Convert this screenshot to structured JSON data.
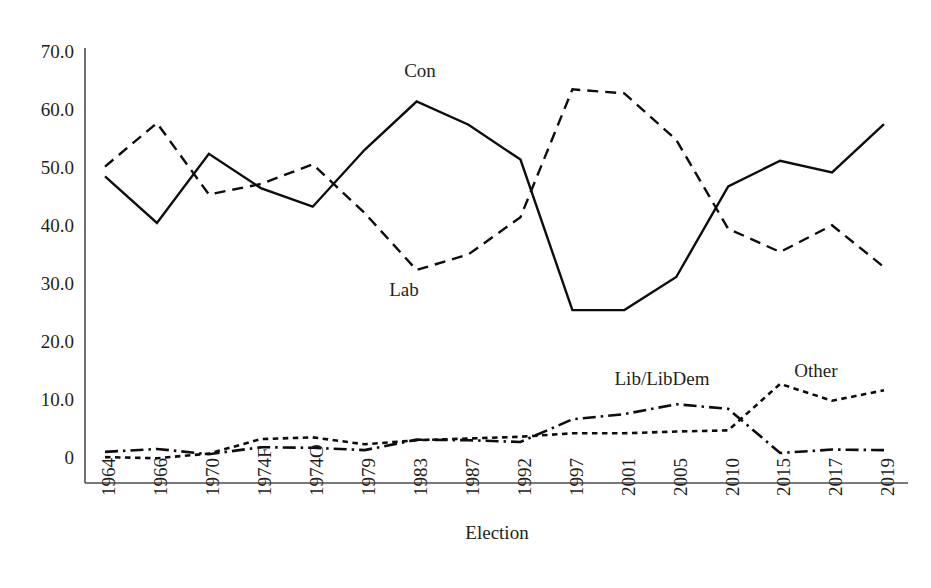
{
  "chart_data": {
    "type": "line",
    "title": "",
    "xlabel": "Election",
    "ylabel": "",
    "ylim": [
      0,
      75
    ],
    "yticks": [
      "0",
      "10.0",
      "20.0",
      "30.0",
      "40.0",
      "50.0",
      "60.0",
      "70.0"
    ],
    "ytick_values": [
      0,
      10,
      20,
      30,
      40,
      50,
      60,
      70
    ],
    "grid": false,
    "legend_position": "inline-annotations",
    "categories": [
      "1964",
      "1966",
      "1970",
      "1974F",
      "1974O",
      "1979",
      "1983",
      "1987",
      "1992",
      "1997",
      "2001",
      "2005",
      "2010",
      "2015",
      "2017",
      "2019"
    ],
    "series": [
      {
        "name": "Con",
        "label": "Con",
        "line_style": "solid",
        "color": "#0d0d0d",
        "values": [
          48.8,
          40.8,
          52.7,
          46.8,
          43.6,
          53.4,
          61.7,
          57.7,
          51.7,
          25.8,
          25.8,
          31.5,
          47.1,
          51.5,
          49.5,
          57.8
        ]
      },
      {
        "name": "Lab",
        "label": "Lab",
        "line_style": "dashed",
        "color": "#0d0d0d",
        "values": [
          50.5,
          58.0,
          45.7,
          47.5,
          50.9,
          42.5,
          32.7,
          35.4,
          41.8,
          63.8,
          63.1,
          55.1,
          39.8,
          35.8,
          40.4,
          33.2
        ]
      },
      {
        "name": "Lib/LibDem",
        "label": "Lib/LibDem",
        "line_style": "dash-dot",
        "color": "#0d0d0d",
        "values": [
          1.4,
          1.9,
          1.0,
          2.2,
          2.1,
          1.7,
          3.5,
          3.4,
          3.1,
          7.0,
          7.9,
          9.6,
          8.8,
          1.2,
          1.8,
          1.7
        ]
      },
      {
        "name": "Other",
        "label": "Other",
        "line_style": "dotted",
        "color": "#0d0d0d",
        "values": [
          0.5,
          0.3,
          1.1,
          3.6,
          3.9,
          2.7,
          3.4,
          3.7,
          4.0,
          4.6,
          4.6,
          4.9,
          5.1,
          13.1,
          10.2,
          12.0
        ]
      }
    ],
    "annotations": [
      {
        "text": "Con",
        "x_pixel": 420,
        "y_pixel": 73
      },
      {
        "text": "Lab",
        "x_pixel": 404,
        "y_pixel": 292
      },
      {
        "text": "Lib/LibDem",
        "x_pixel": 662,
        "y_pixel": 381
      },
      {
        "text": "Other",
        "x_pixel": 816,
        "y_pixel": 373
      }
    ]
  }
}
